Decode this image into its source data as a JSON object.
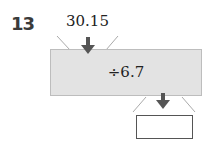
{
  "problem": {
    "number": "13",
    "input_value": "30.15",
    "operation": "÷6.7",
    "answer": ""
  },
  "icons": {
    "input_arrow": "arrow-down-icon",
    "output_arrow": "arrow-down-icon"
  },
  "colors": {
    "machine_fill": "#e3e3e3",
    "arrow": "#555555"
  }
}
